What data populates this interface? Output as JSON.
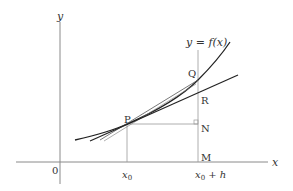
{
  "diagram": {
    "axes": {
      "x_label": "x",
      "y_label": "y",
      "origin_label": "0"
    },
    "curve_label": "y = f(x)",
    "points": {
      "P": "P",
      "Q": "Q",
      "R": "R",
      "N": "N",
      "M": "M"
    },
    "x_ticks": {
      "x0": "x",
      "x0_sub": "0",
      "x0h": "x",
      "x0h_sub": "0",
      "x0h_rest": " + h"
    },
    "colors": {
      "curve": "#222222",
      "axis": "#888888",
      "guide": "#999999"
    }
  }
}
